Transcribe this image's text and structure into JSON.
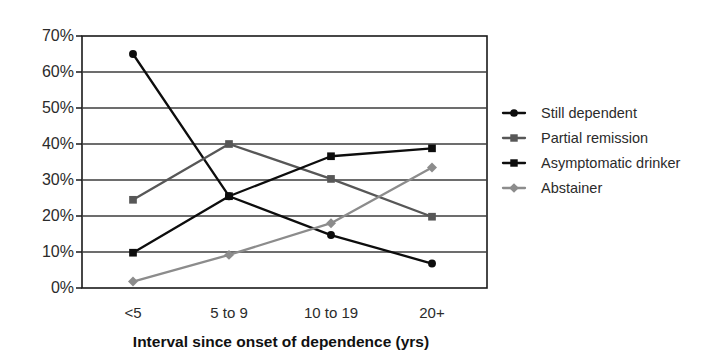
{
  "chart_data": {
    "type": "line",
    "title": "",
    "subtitle": "",
    "xlabel": "Interval since onset of dependence (yrs)",
    "ylabel": "",
    "categories": [
      "<5",
      "5 to 9",
      "10 to 19",
      "20+"
    ],
    "ylim": [
      0,
      70
    ],
    "ytick_labels": [
      "0%",
      "10%",
      "20%",
      "30%",
      "40%",
      "50%",
      "60%",
      "70%"
    ],
    "ytick_values": [
      0,
      10,
      20,
      30,
      40,
      50,
      60,
      70
    ],
    "grid": "horizontal",
    "legend_position": "right",
    "series": [
      {
        "name": "Still dependent",
        "marker": "circle",
        "color": "#0d0d0d",
        "values": [
          65.0,
          25.5,
          14.7,
          6.8
        ]
      },
      {
        "name": "Partial remission",
        "marker": "square",
        "color": "#575757",
        "values": [
          24.5,
          40.0,
          30.3,
          19.8
        ]
      },
      {
        "name": "Asymptomatic drinker",
        "marker": "square",
        "color": "#0d0d0d",
        "values": [
          9.8,
          25.5,
          36.6,
          38.8
        ]
      },
      {
        "name": "Abstainer",
        "marker": "diamond",
        "color": "#8c8c8c",
        "values": [
          1.8,
          9.2,
          18.0,
          33.5
        ]
      }
    ]
  },
  "axes": {
    "y_tick_0": "0%",
    "y_tick_1": "10%",
    "y_tick_2": "20%",
    "y_tick_3": "30%",
    "y_tick_4": "40%",
    "y_tick_5": "50%",
    "y_tick_6": "60%",
    "y_tick_7": "70%",
    "x_cat_0": "<5",
    "x_cat_1": "5 to 9",
    "x_cat_2": "10 to 19",
    "x_cat_3": "20+",
    "x_axis_title": "Interval since onset of dependence (yrs)"
  },
  "legend": {
    "items": [
      {
        "label": "Still dependent"
      },
      {
        "label": "Partial remission"
      },
      {
        "label": "Asymptomatic drinker"
      },
      {
        "label": "Abstainer"
      }
    ]
  },
  "style": {
    "frame_color": "#1a1a1a",
    "grid_color": "#3d3d3d",
    "background": "#ffffff"
  }
}
